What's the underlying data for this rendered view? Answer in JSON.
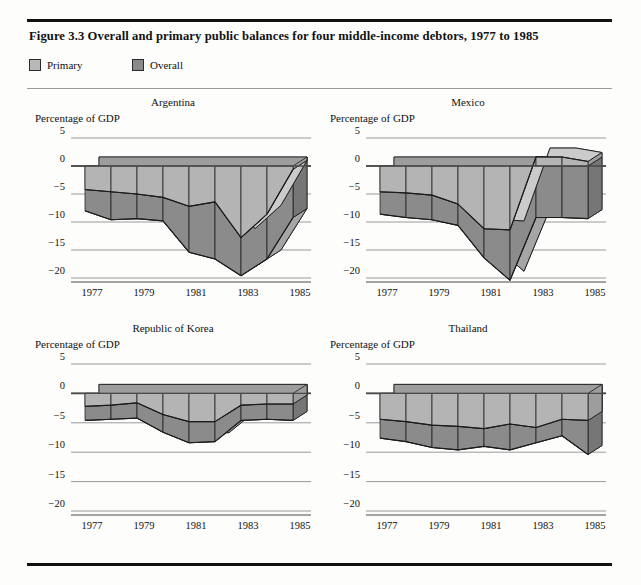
{
  "figure": {
    "title": "Figure 3.3  Overall and primary public balances for four middle-income debtors, 1977 to 1985"
  },
  "legend": {
    "primary_label": "Primary",
    "overall_label": "Overall",
    "primary_color": "#b9b9b9",
    "overall_color": "#8a8a8a"
  },
  "axis": {
    "ylabel": "Percentage of GDP",
    "yticks": [
      "5",
      "0",
      "-5",
      "-10",
      "-15",
      "-20"
    ],
    "ytick_values": [
      5,
      0,
      -5,
      -10,
      -15,
      -20
    ],
    "xticks": [
      "1977",
      "1979",
      "1981",
      "1983",
      "1985"
    ],
    "xtick_values": [
      1977,
      1979,
      1981,
      1983,
      1985
    ]
  },
  "chart_data": [
    {
      "type": "area",
      "title": "Argentina",
      "xlabel": "",
      "ylabel": "Percentage of GDP",
      "ylim": [
        -22,
        5
      ],
      "xlim": [
        1977,
        1985
      ],
      "grid": true,
      "legend_position": "top-left-outside",
      "x": [
        1977,
        1978,
        1979,
        1980,
        1981,
        1982,
        1983,
        1984,
        1985
      ],
      "series": [
        {
          "name": "Primary",
          "values": [
            -4.2,
            -4.6,
            -5.0,
            -5.6,
            -7.2,
            -6.4,
            -12.8,
            -8.6,
            -0.6
          ]
        },
        {
          "name": "Overall",
          "values": [
            -8.0,
            -9.6,
            -9.4,
            -9.8,
            -15.4,
            -16.6,
            -19.6,
            -16.6,
            -9.2
          ]
        }
      ]
    },
    {
      "type": "area",
      "title": "Mexico",
      "xlabel": "",
      "ylabel": "Percentage of GDP",
      "ylim": [
        -22,
        5
      ],
      "xlim": [
        1977,
        1985
      ],
      "grid": true,
      "legend_position": "top-left-outside",
      "x": [
        1977,
        1978,
        1979,
        1980,
        1981,
        1982,
        1983,
        1984,
        1985
      ],
      "series": [
        {
          "name": "Primary",
          "values": [
            -4.6,
            -4.8,
            -5.2,
            -6.8,
            -11.2,
            -11.4,
            1.6,
            1.6,
            0.8
          ]
        },
        {
          "name": "Overall",
          "values": [
            -8.6,
            -9.2,
            -9.6,
            -10.6,
            -16.4,
            -20.4,
            -9.2,
            -9.2,
            -9.4
          ]
        }
      ]
    },
    {
      "type": "area",
      "title": "Republic of Korea",
      "xlabel": "",
      "ylabel": "Percentage of GDP",
      "ylim": [
        -22,
        5
      ],
      "xlim": [
        1977,
        1985
      ],
      "grid": true,
      "legend_position": "top-left-outside",
      "x": [
        1977,
        1978,
        1979,
        1980,
        1981,
        1982,
        1983,
        1984,
        1985
      ],
      "series": [
        {
          "name": "Primary",
          "values": [
            -2.2,
            -2.0,
            -1.6,
            -3.6,
            -4.8,
            -4.8,
            -2.0,
            -1.8,
            -1.8
          ]
        },
        {
          "name": "Overall",
          "values": [
            -4.6,
            -4.4,
            -4.2,
            -6.6,
            -8.4,
            -8.2,
            -4.6,
            -4.4,
            -4.6
          ]
        }
      ]
    },
    {
      "type": "area",
      "title": "Thailand",
      "xlabel": "",
      "ylabel": "Percentage of GDP",
      "ylim": [
        -22,
        5
      ],
      "xlim": [
        1977,
        1985
      ],
      "grid": true,
      "legend_position": "top-left-outside",
      "x": [
        1977,
        1978,
        1979,
        1980,
        1981,
        1982,
        1983,
        1984,
        1985
      ],
      "series": [
        {
          "name": "Primary",
          "values": [
            -4.4,
            -4.8,
            -5.4,
            -5.6,
            -6.0,
            -5.2,
            -5.8,
            -4.4,
            -4.6
          ]
        },
        {
          "name": "Overall",
          "values": [
            -7.6,
            -8.2,
            -9.2,
            -9.6,
            -9.0,
            -9.6,
            -8.4,
            -7.2,
            -10.4
          ]
        }
      ]
    }
  ]
}
